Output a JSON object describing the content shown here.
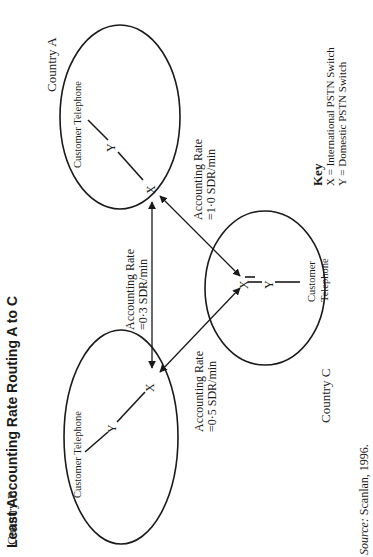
{
  "title": "Least Accounting Rate Routing A to C",
  "countries": [
    {
      "id": "A",
      "label": "Country A",
      "customer_label": "Customer Telephone"
    },
    {
      "id": "B",
      "label": "Country B",
      "customer_label": "Customer Telephone"
    },
    {
      "id": "C",
      "label": "Country C",
      "customer_label_line1": "Customer",
      "customer_label_line2": "Telephone"
    }
  ],
  "nodes": {
    "international_switch": "X",
    "domestic_switch": "Y"
  },
  "links": [
    {
      "from": "A",
      "to": "B",
      "label_line1": "Accounting Rate",
      "label_line2": "=0·3 SDR/min"
    },
    {
      "from": "A",
      "to": "C",
      "label_line1": "Accounting Rate",
      "label_line2": "=1·0 SDR/min"
    },
    {
      "from": "B",
      "to": "C",
      "label_line1": "Accounting Rate",
      "label_line2": "=0·5 SDR/min"
    }
  ],
  "key": {
    "title": "Key",
    "items": [
      "X = International PSTN Switch",
      "Y = Domestic PSTN Switch"
    ]
  },
  "source": {
    "prefix": "Source:",
    "text": " Scanlan, 1996."
  },
  "colors": {
    "line": "#1a1a1a",
    "background": "#ffffff"
  }
}
